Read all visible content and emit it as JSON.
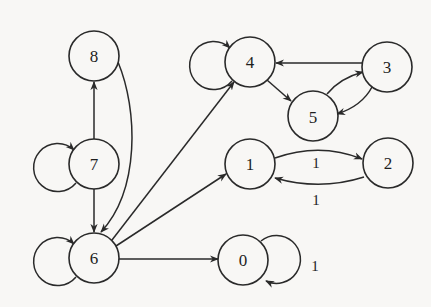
{
  "diagram": {
    "type": "directed-graph",
    "nodes": [
      {
        "id": "0",
        "label": "0"
      },
      {
        "id": "1",
        "label": "1"
      },
      {
        "id": "2",
        "label": "2"
      },
      {
        "id": "3",
        "label": "3"
      },
      {
        "id": "4",
        "label": "4"
      },
      {
        "id": "5",
        "label": "5"
      },
      {
        "id": "6",
        "label": "6"
      },
      {
        "id": "7",
        "label": "7"
      },
      {
        "id": "8",
        "label": "8"
      }
    ],
    "edges": [
      {
        "from": "7",
        "to": "8",
        "label": ""
      },
      {
        "from": "8",
        "to": "6",
        "label": ""
      },
      {
        "from": "7",
        "to": "6",
        "label": ""
      },
      {
        "from": "7",
        "to": "7",
        "label": "",
        "self_loop": true
      },
      {
        "from": "6",
        "to": "6",
        "label": "",
        "self_loop": true
      },
      {
        "from": "6",
        "to": "4",
        "label": ""
      },
      {
        "from": "6",
        "to": "1",
        "label": ""
      },
      {
        "from": "6",
        "to": "0",
        "label": ""
      },
      {
        "from": "4",
        "to": "4",
        "label": "",
        "self_loop": true
      },
      {
        "from": "4",
        "to": "5",
        "label": ""
      },
      {
        "from": "3",
        "to": "4",
        "label": ""
      },
      {
        "from": "5",
        "to": "3",
        "label": ""
      },
      {
        "from": "3",
        "to": "5",
        "label": ""
      },
      {
        "from": "1",
        "to": "2",
        "label": "1"
      },
      {
        "from": "2",
        "to": "1",
        "label": "1"
      },
      {
        "from": "0",
        "to": "0",
        "label": "1",
        "self_loop": true
      }
    ],
    "edge_labels": {
      "e12": "1",
      "e21": "1",
      "e00": "1"
    }
  }
}
